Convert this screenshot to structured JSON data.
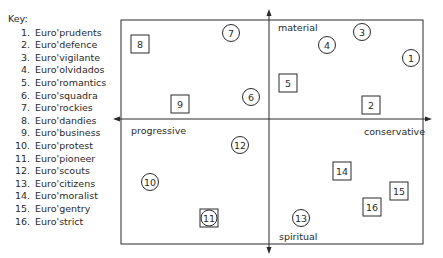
{
  "key": {
    "title": "Key:",
    "items": [
      {
        "num": "1.",
        "label": "Euro'prudents"
      },
      {
        "num": "2.",
        "label": "Euro'defence"
      },
      {
        "num": "3.",
        "label": "Euro'vigilante"
      },
      {
        "num": "4.",
        "label": "Euro'olvidados"
      },
      {
        "num": "5.",
        "label": "Euro'romantics"
      },
      {
        "num": "6.",
        "label": "Euro'squadra"
      },
      {
        "num": "7.",
        "label": "Euro'rockies"
      },
      {
        "num": "8.",
        "label": "Euro'dandies"
      },
      {
        "num": "9.",
        "label": "Euro'business"
      },
      {
        "num": "10.",
        "label": "Euro'protest"
      },
      {
        "num": "11.",
        "label": "Euro'pioneer"
      },
      {
        "num": "12.",
        "label": "Euro'scouts"
      },
      {
        "num": "13.",
        "label": "Euro'citizens"
      },
      {
        "num": "14.",
        "label": "Euro'moralist"
      },
      {
        "num": "15.",
        "label": "Euro'gentry"
      },
      {
        "num": "16.",
        "label": "Euro'strict"
      }
    ]
  },
  "axes": {
    "top": "material",
    "bottom": "spiritual",
    "left": "progressive",
    "right": "conservative"
  },
  "markers": [
    {
      "id": "1",
      "shape": "circle",
      "x": 411,
      "y": 58
    },
    {
      "id": "2",
      "shape": "square",
      "x": 371,
      "y": 105
    },
    {
      "id": "3",
      "shape": "circle",
      "x": 362,
      "y": 32
    },
    {
      "id": "4",
      "shape": "circle",
      "x": 327,
      "y": 45
    },
    {
      "id": "5",
      "shape": "square",
      "x": 288,
      "y": 83
    },
    {
      "id": "6",
      "shape": "circle",
      "x": 251,
      "y": 97
    },
    {
      "id": "7",
      "shape": "circle",
      "x": 231,
      "y": 33
    },
    {
      "id": "8",
      "shape": "square",
      "x": 140,
      "y": 44
    },
    {
      "id": "9",
      "shape": "square",
      "x": 180,
      "y": 104
    },
    {
      "id": "10",
      "shape": "circle",
      "x": 150,
      "y": 182
    },
    {
      "id": "11",
      "shape": "square-circle",
      "x": 209,
      "y": 218
    },
    {
      "id": "12",
      "shape": "circle",
      "x": 240,
      "y": 145
    },
    {
      "id": "13",
      "shape": "circle",
      "x": 301,
      "y": 218
    },
    {
      "id": "14",
      "shape": "square",
      "x": 342,
      "y": 171
    },
    {
      "id": "15",
      "shape": "square",
      "x": 399,
      "y": 191
    },
    {
      "id": "16",
      "shape": "square",
      "x": 372,
      "y": 207
    }
  ],
  "colors": {
    "ink": "#2a2a2a",
    "background": "#ffffff"
  }
}
